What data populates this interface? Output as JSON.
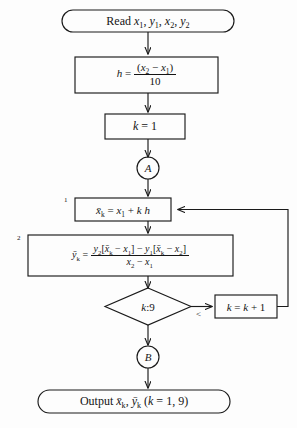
{
  "diagram": {
    "type": "flowchart",
    "stroke_color": "#1a1a1a",
    "background_color": "#fdfdfd"
  },
  "nodes": {
    "read": {
      "shape": "terminator",
      "label": "Read x1, y1, x2, y2",
      "text_prefix": "Read ",
      "vars": [
        "x",
        "y",
        "x",
        "y"
      ],
      "subs": [
        "1",
        "1",
        "2",
        "2"
      ]
    },
    "h_step": {
      "shape": "process",
      "lhs": "h",
      "equals": "=",
      "numerator": "(x2 − x1)",
      "denominator": "10"
    },
    "k_init": {
      "shape": "process",
      "label": "k = 1"
    },
    "connector_a": {
      "shape": "connector",
      "label": "A"
    },
    "xbar_step": {
      "shape": "process",
      "step_number": "1",
      "label": "x̄k = x1 + k h"
    },
    "ybar_step": {
      "shape": "process",
      "step_number": "2",
      "lhs": "ȳk",
      "equals": "=",
      "numerator": "y2[x̄k − x1] − y1[x̄k − x2]",
      "denominator": "x2 − x1"
    },
    "decision": {
      "shape": "decision",
      "label": "k:9",
      "branch_label": "<"
    },
    "k_increment": {
      "shape": "process",
      "label": "k = k + 1"
    },
    "connector_b": {
      "shape": "connector",
      "label": "B"
    },
    "output": {
      "shape": "terminator",
      "label": "Output x̄k, ȳk (k = 1, 9)",
      "text_prefix": "Output "
    }
  }
}
